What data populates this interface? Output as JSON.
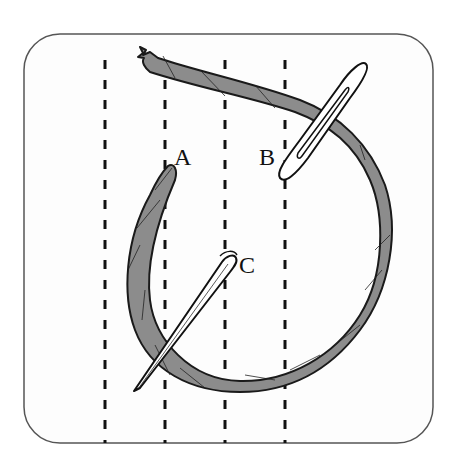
{
  "diagram": {
    "labels": {
      "a": "A",
      "b": "B",
      "c": "C"
    },
    "guide_lines": {
      "count": 4,
      "style": "dashed",
      "x_positions": [
        105,
        165,
        225,
        285
      ]
    },
    "colors": {
      "frame_stroke": "#555555",
      "background": "#fdfdfd",
      "thread_fill": "#8c8c8c",
      "thread_stroke": "#1a1a1a",
      "needle_fill": "#ffffff",
      "needle_stroke": "#111111",
      "dash_color": "#111111",
      "label_color": "#111111"
    }
  }
}
